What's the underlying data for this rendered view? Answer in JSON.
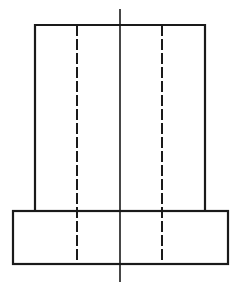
{
  "figure": {
    "type": "orthographic-front-view",
    "colors": {
      "line": "#1a1a1a",
      "background": "#ffffff"
    },
    "upper_body": {
      "x1": 35,
      "y1": 25,
      "x2": 205,
      "y2": 211
    },
    "flange": {
      "x1": 13,
      "y1": 211,
      "x2": 228,
      "y2": 264
    },
    "hidden_lines": [
      {
        "x": 77,
        "y1": 25,
        "y2": 264
      },
      {
        "x": 162,
        "y1": 25,
        "y2": 264
      }
    ],
    "center_axis": {
      "x": 120,
      "y1": 9,
      "y2": 282
    }
  }
}
